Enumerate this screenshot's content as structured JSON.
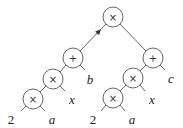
{
  "diagram": {
    "type": "expression-tree",
    "nodes": [
      {
        "id": "root",
        "op": "×",
        "x": 113,
        "y": 17
      },
      {
        "id": "lplus",
        "op": "+",
        "x": 73,
        "y": 58
      },
      {
        "id": "lmul1",
        "op": "×",
        "x": 53,
        "y": 79
      },
      {
        "id": "lmul2",
        "op": "×",
        "x": 33,
        "y": 99
      },
      {
        "id": "rplus",
        "op": "+",
        "x": 153,
        "y": 58
      },
      {
        "id": "rmul1",
        "op": "×",
        "x": 133,
        "y": 78
      },
      {
        "id": "rmul2",
        "op": "×",
        "x": 113,
        "y": 98
      }
    ],
    "leaves": [
      {
        "id": "l2",
        "label": "2",
        "x": 11,
        "y": 119,
        "italic": false
      },
      {
        "id": "la",
        "label": "a",
        "x": 52,
        "y": 119,
        "italic": true
      },
      {
        "id": "lx",
        "label": "x",
        "x": 72,
        "y": 99,
        "italic": true
      },
      {
        "id": "lb",
        "label": "b",
        "x": 90,
        "y": 79,
        "italic": true
      },
      {
        "id": "r2",
        "label": "2",
        "x": 93,
        "y": 119,
        "italic": false
      },
      {
        "id": "ra",
        "label": "a",
        "x": 132,
        "y": 119,
        "italic": true
      },
      {
        "id": "rx",
        "label": "x",
        "x": 152,
        "y": 99,
        "italic": true
      },
      {
        "id": "rc",
        "label": "c",
        "x": 171,
        "y": 78,
        "italic": true
      }
    ],
    "expression": "((2×a)×x + b) × ((2×a)×x + c)"
  }
}
